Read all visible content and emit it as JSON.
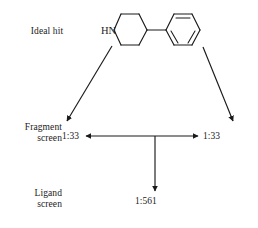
{
  "figure": {
    "background_color": "#ffffff",
    "line_color": "#1a1a1a",
    "text_color": "#1a1a1a"
  },
  "labels": {
    "ideal_hit": "Ideal hit",
    "fragment_screen": "Fragment\nscreen",
    "ligand_screen": "Ligand\nscreen"
  },
  "ratios": {
    "left": "1:33",
    "right": "1:33",
    "bottom": "1:561"
  },
  "molecule": {
    "name": "4-phenylpiperidine",
    "atom_labels": {
      "nitrogen": "HN"
    }
  }
}
